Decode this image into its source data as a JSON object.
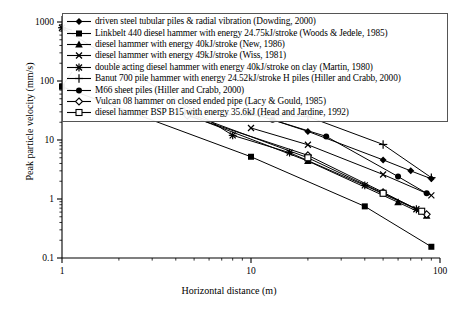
{
  "chart_data": {
    "type": "line",
    "title": "",
    "subtitle": "",
    "xlabel": "Horizontal distance (m)",
    "ylabel": "Peak particle velocity (mm/s)",
    "xscale": "log",
    "yscale": "log",
    "xlim": [
      1,
      100
    ],
    "ylim": [
      0.1,
      1000
    ],
    "xticks": [
      1,
      10,
      100
    ],
    "xtick_labels": [
      "1",
      "10",
      "100"
    ],
    "yticks": [
      0.1,
      1,
      10,
      100,
      1000
    ],
    "ytick_labels": [
      "0.1",
      "1",
      "10",
      "100",
      "1000"
    ],
    "grid": false,
    "legend_position": "upper-inside",
    "series": [
      {
        "name": "driven steel tubular piles & radial vibration (Dowding, 2000)",
        "marker": "filled-diamond",
        "points": [
          [
            10,
            29
          ],
          [
            20,
            14
          ],
          [
            50,
            4.6
          ],
          [
            70,
            3.0
          ],
          [
            90,
            2.2
          ]
        ]
      },
      {
        "name": "Linkbelt 440 diesel hammer with energy 24.75kJ/stroke (Woods & Jedele, 1985)",
        "marker": "filled-square",
        "points": [
          [
            1,
            80
          ],
          [
            10,
            5.2
          ],
          [
            40,
            0.75
          ],
          [
            90,
            0.155
          ]
        ]
      },
      {
        "name": "diesel hammer with energy 40kJ/stroke (New, 1986)",
        "marker": "filled-triangle",
        "points": [
          [
            4.2,
            30
          ],
          [
            20,
            4.4
          ],
          [
            60,
            0.88
          ],
          [
            85,
            0.52
          ]
        ]
      },
      {
        "name": "diesel hammer with energy 49kJ/stroke (Wiss, 1981)",
        "marker": "x-cross",
        "points": [
          [
            10,
            16
          ],
          [
            20,
            8.3
          ],
          [
            50,
            2.6
          ],
          [
            90,
            1.15
          ]
        ]
      },
      {
        "name": "double acting diesel hammer with energy 40kJ/stroke on clay (Martin, 1980)",
        "marker": "star",
        "points": [
          [
            1,
            800
          ],
          [
            8,
            12
          ],
          [
            16,
            6.1
          ],
          [
            40,
            1.7
          ],
          [
            75,
            0.67
          ]
        ]
      },
      {
        "name": "Banut 700 pile hammer with energy 24.52kJ/stroke H piles (Hiller and Crabb, 2000)",
        "marker": "plus",
        "points": [
          [
            4.5,
            28
          ],
          [
            20,
            25
          ],
          [
            50,
            8.4
          ],
          [
            90,
            2.3
          ]
        ]
      },
      {
        "name": "M66 sheet piles (Hiller and Crabb, 2000)",
        "marker": "filled-circle",
        "points": [
          [
            13,
            22
          ],
          [
            25,
            11.5
          ],
          [
            60,
            2.4
          ],
          [
            85,
            1.25
          ]
        ]
      },
      {
        "name": "Vulcan 08 hammer on closed ended pipe (Lacy & Gould, 1985)",
        "marker": "open-diamond",
        "points": [
          [
            4.6,
            26
          ],
          [
            20,
            5.5
          ],
          [
            50,
            1.3
          ],
          [
            85,
            0.55
          ]
        ]
      },
      {
        "name": "diesel hammer BSP B15 with energy 35.6kJ (Head and Jardine, 1992)",
        "marker": "open-square",
        "points": [
          [
            4.3,
            31
          ],
          [
            20,
            5.0
          ],
          [
            50,
            1.25
          ],
          [
            80,
            0.62
          ]
        ]
      }
    ],
    "colors": {
      "line": "#000000",
      "axis": "#000000",
      "background": "#ffffff",
      "legend_border": "#555555"
    }
  },
  "legend": {
    "items": [
      {
        "label": "driven steel tubular piles & radial vibration (Dowding, 2000)",
        "marker": "filled-diamond"
      },
      {
        "label": "Linkbelt 440 diesel hammer with energy 24.75kJ/stroke (Woods & Jedele, 1985)",
        "marker": "filled-square"
      },
      {
        "label": "diesel hammer with energy 40kJ/stroke (New, 1986)",
        "marker": "filled-triangle"
      },
      {
        "label": "diesel hammer with energy 49kJ/stroke (Wiss, 1981)",
        "marker": "x-cross"
      },
      {
        "label": "double acting diesel hammer with energy 40kJ/stroke on clay (Martin, 1980)",
        "marker": "star"
      },
      {
        "label": "Banut 700 pile hammer with energy 24.52kJ/stroke H piles (Hiller and Crabb, 2000)",
        "marker": "plus"
      },
      {
        "label": "M66 sheet piles (Hiller and Crabb, 2000)",
        "marker": "filled-circle"
      },
      {
        "label": "Vulcan 08 hammer on closed ended pipe (Lacy & Gould, 1985)",
        "marker": "open-diamond"
      },
      {
        "label": "diesel hammer BSP B15 with energy 35.6kJ (Head and Jardine, 1992)",
        "marker": "open-square"
      }
    ]
  }
}
